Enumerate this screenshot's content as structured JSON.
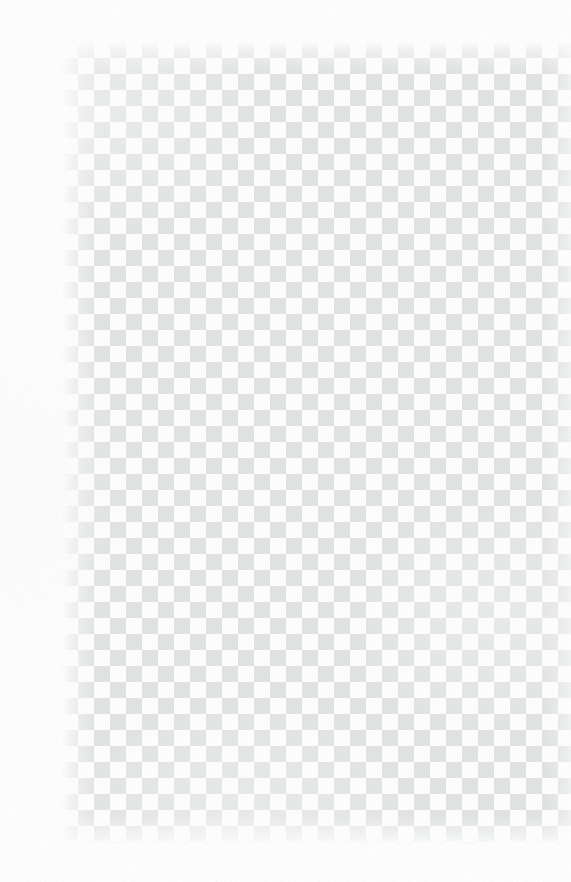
{
  "image": {
    "kind": "transparency-checkerboard",
    "description": "Alpha-channel transparency checkerboard placeholder",
    "width_px": 571,
    "height_px": 882,
    "has_foreground_content": false
  },
  "checkerboard": {
    "cell_size_px": 16,
    "tile_size_px": 32,
    "light_color": "#ffffff",
    "dark_color": "#e3e5e5",
    "origin_x_px": 62,
    "origin_y_px": 42,
    "bottom_edge_y_px": 845,
    "right_edge_x_px": 571,
    "first_cell_shade": "dark"
  },
  "page": {
    "background_color": "#ffffff",
    "left_margin_px": 62,
    "top_margin_px": 42,
    "bottom_margin_px": 37,
    "right_margin_px": 0,
    "texture": "paper-grain",
    "vignette": "soft-white-edges"
  },
  "overlays": {
    "grain_opacity": 0.55,
    "vignette_opacity": 0.3,
    "blotches_opacity": 0.4
  }
}
